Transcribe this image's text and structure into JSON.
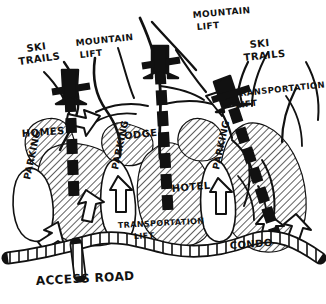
{
  "diagram": {
    "style": "hand-drawn black ink sketch on white",
    "colors": {
      "ink": "#111111",
      "paper": "#ffffff",
      "hatch": "#1a1a1a",
      "hatch_tone": "#9a9a9a"
    }
  },
  "labels": {
    "ski_trails_left": "SKI\nTRAILS",
    "ski_trails_left_l1": "SKI",
    "ski_trails_left_l2": "TRAILS",
    "mountain_lift_left_l1": "MOUNTAIN",
    "mountain_lift_left_l2": "LIFT",
    "mountain_lift_center_l1": "MOUNTAIN",
    "mountain_lift_center_l2": "LIFT",
    "ski_trails_right_l1": "SKI",
    "ski_trails_right_l2": "TRAILS",
    "transportation_lift_upper_l1": "TRANSPORTATION",
    "transportation_lift_upper_l2": "LIFT",
    "transportation_lift_lower_l1": "TRANSPORTATION",
    "transportation_lift_lower_l2": "LIFT",
    "homes": "HOMES",
    "lodge": "LODGE",
    "hotel": "HOTEL",
    "condo": "CONDO",
    "parking_left": "PARKING",
    "parking_center": "PARKING",
    "parking_right": "PARKING",
    "access_road": "ACCESS ROAD"
  },
  "elements": {
    "lifts": [
      {
        "name": "mountain-lift-left",
        "label": "MOUNTAIN LIFT",
        "type": "dashed-arrow-corridor"
      },
      {
        "name": "mountain-lift-center",
        "label": "MOUNTAIN LIFT",
        "type": "dashed-arrow-corridor"
      },
      {
        "name": "transportation-lift-right",
        "label": "TRANSPORTATION LIFT",
        "type": "dashed-arrow-corridor"
      }
    ],
    "development_zones": [
      {
        "name": "homes-zone",
        "label": "HOMES"
      },
      {
        "name": "lodge-zone",
        "label": "LODGE"
      },
      {
        "name": "hotel-zone",
        "label": "HOTEL"
      },
      {
        "name": "condo-zone",
        "label": "CONDO"
      }
    ],
    "parking_lots": [
      {
        "name": "parking-left",
        "label": "PARKING"
      },
      {
        "name": "parking-center",
        "label": "PARKING"
      },
      {
        "name": "parking-right",
        "label": "PARKING"
      }
    ],
    "roads": [
      {
        "name": "access-road",
        "label": "ACCESS ROAD",
        "type": "ladder-hatched-road"
      }
    ],
    "circulation_arrows": 6
  }
}
